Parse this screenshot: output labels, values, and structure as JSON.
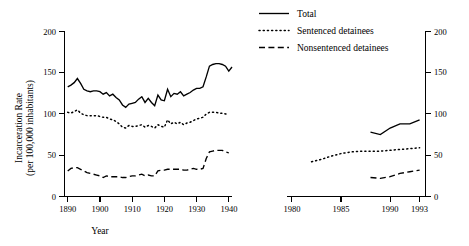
{
  "chart_data": {
    "type": "line",
    "title": "",
    "xlabel": "Year",
    "ylabel": "Incarceration Rate (per 100,000 inhabitants)",
    "ylabel_line1": "Incarceration Rate",
    "ylabel_line2": "(per 100,000 inhabitants)",
    "ylim": [
      0,
      200
    ],
    "yticks": [
      0,
      50,
      100,
      150,
      200
    ],
    "yticklabels": [
      "0",
      "50",
      "100",
      "150",
      "200"
    ],
    "grid": false,
    "legend_position": "top-right",
    "broken_axis": true,
    "panels": [
      {
        "name": "historical",
        "xlim": [
          1889,
          1941
        ],
        "xticks": [
          1890,
          1900,
          1910,
          1920,
          1930,
          1940
        ],
        "xticklabels": [
          "1890",
          "1900",
          "1910",
          "1920",
          "1930",
          "1940"
        ],
        "series": [
          {
            "name": "Total",
            "style": "solid",
            "x": [
              1890,
              1891,
              1892,
              1893,
              1894,
              1895,
              1896,
              1897,
              1898,
              1899,
              1900,
              1901,
              1902,
              1903,
              1904,
              1905,
              1906,
              1907,
              1908,
              1909,
              1910,
              1911,
              1912,
              1913,
              1914,
              1915,
              1916,
              1917,
              1918,
              1919,
              1920,
              1921,
              1922,
              1923,
              1924,
              1925,
              1926,
              1927,
              1928,
              1929,
              1930,
              1931,
              1932,
              1933,
              1934,
              1935,
              1936,
              1937,
              1938,
              1939,
              1940,
              1941
            ],
            "values": [
              133,
              135,
              138,
              143,
              137,
              130,
              128,
              127,
              128,
              128,
              127,
              124,
              126,
              122,
              124,
              120,
              117,
              111,
              108,
              112,
              113,
              114,
              118,
              121,
              114,
              119,
              114,
              110,
              123,
              117,
              116,
              130,
              121,
              125,
              124,
              127,
              122,
              124,
              126,
              129,
              131,
              131,
              133,
              145,
              158,
              160,
              161,
              161,
              160,
              158,
              152,
              157
            ]
          },
          {
            "name": "Sentenced detainees",
            "style": "dotted",
            "x": [
              1890,
              1891,
              1892,
              1893,
              1894,
              1895,
              1896,
              1897,
              1898,
              1899,
              1900,
              1901,
              1902,
              1903,
              1904,
              1905,
              1906,
              1907,
              1908,
              1909,
              1910,
              1911,
              1912,
              1913,
              1914,
              1915,
              1916,
              1917,
              1918,
              1919,
              1920,
              1921,
              1922,
              1923,
              1924,
              1925,
              1926,
              1927,
              1928,
              1929,
              1930,
              1931,
              1932,
              1933,
              1934,
              1935,
              1936,
              1937,
              1938,
              1939,
              1940
            ],
            "values": [
              102,
              101,
              103,
              105,
              101,
              99,
              98,
              98,
              98,
              98,
              97,
              96,
              96,
              94,
              93,
              91,
              88,
              84,
              83,
              86,
              85,
              85,
              86,
              87,
              84,
              86,
              85,
              83,
              87,
              85,
              84,
              93,
              88,
              90,
              88,
              90,
              87,
              89,
              90,
              92,
              94,
              95,
              96,
              100,
              102,
              102,
              102,
              101,
              101,
              100,
              100
            ]
          },
          {
            "name": "Nonsentenced detainees",
            "style": "dashed",
            "x": [
              1890,
              1891,
              1892,
              1893,
              1894,
              1895,
              1896,
              1897,
              1898,
              1899,
              1900,
              1901,
              1902,
              1903,
              1904,
              1905,
              1906,
              1907,
              1908,
              1909,
              1910,
              1911,
              1912,
              1913,
              1914,
              1915,
              1916,
              1917,
              1918,
              1919,
              1920,
              1921,
              1922,
              1923,
              1924,
              1925,
              1926,
              1927,
              1928,
              1929,
              1930,
              1931,
              1932,
              1933,
              1934,
              1935,
              1936,
              1937,
              1938,
              1939,
              1940
            ],
            "values": [
              31,
              34,
              35,
              35,
              33,
              31,
              29,
              28,
              27,
              26,
              25,
              23,
              25,
              24,
              24,
              24,
              24,
              23,
              23,
              24,
              25,
              25,
              26,
              27,
              25,
              26,
              25,
              25,
              31,
              32,
              32,
              33,
              33,
              33,
              33,
              33,
              32,
              32,
              33,
              34,
              33,
              33,
              34,
              46,
              54,
              55,
              56,
              56,
              56,
              54,
              53
            ]
          }
        ]
      },
      {
        "name": "modern",
        "xlim": [
          1979.5,
          1993.6
        ],
        "xticks": [
          1980,
          1985,
          1990,
          1993
        ],
        "xticklabels": [
          "1980",
          "1985",
          "1990",
          "1993"
        ],
        "series": [
          {
            "name": "Total",
            "style": "solid",
            "x": [
              1988,
              1989,
              1990,
              1991,
              1992,
              1993
            ],
            "values": [
              78,
              75,
              83,
              88,
              88,
              93
            ]
          },
          {
            "name": "Sentenced detainees",
            "style": "dotted",
            "x": [
              1982,
              1983,
              1984,
              1985,
              1986,
              1987,
              1988,
              1989,
              1990,
              1991,
              1992,
              1993
            ],
            "values": [
              42,
              45,
              49,
              52,
              54,
              55,
              55,
              55,
              56,
              57,
              58,
              59
            ]
          },
          {
            "name": "Nonsentenced detainees",
            "style": "dashed",
            "x": [
              1988,
              1989,
              1990,
              1991,
              1992,
              1993
            ],
            "values": [
              23,
              22,
              24,
              28,
              30,
              32
            ]
          }
        ]
      }
    ],
    "legend": [
      {
        "label": "Total",
        "style": "solid"
      },
      {
        "label": "Sentenced detainees",
        "style": "dotted"
      },
      {
        "label": "Nonsentenced detainees",
        "style": "dashed"
      }
    ]
  }
}
